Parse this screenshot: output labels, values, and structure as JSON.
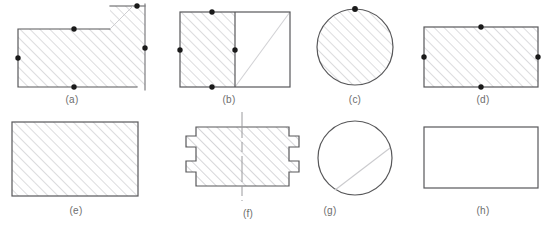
{
  "diagram": {
    "colors": {
      "outline": "#58585a",
      "outline_light": "#7d7d80",
      "hatch": "#c9c9cc",
      "vertex_dot": "#1a1a1a",
      "caption_text": "#6d6d6d",
      "centerline": "#9a9a9d",
      "background": "#ffffff"
    },
    "style": {
      "hatch_angle_deg": 45,
      "hatch_spacing_px": 7,
      "outline_width_px": 1.2,
      "dot_radius_px": 2.6
    },
    "figures": [
      {
        "id": "a",
        "caption": "(a)",
        "shape": "stepped-polygon",
        "hatched": true,
        "dot_count": 4,
        "caption_x": 72,
        "caption_y": 94
      },
      {
        "id": "b",
        "caption": "(b)",
        "shape": "rectangle-divided",
        "hatched": true,
        "dot_count": 4,
        "caption_x": 229,
        "caption_y": 94
      },
      {
        "id": "c",
        "caption": "(c)",
        "shape": "circle",
        "hatched": true,
        "dot_count": 1,
        "caption_x": 355,
        "caption_y": 94
      },
      {
        "id": "d",
        "caption": "(d)",
        "shape": "rectangle",
        "hatched": true,
        "dot_count": 4,
        "caption_x": 483,
        "caption_y": 94
      },
      {
        "id": "e",
        "caption": "(e)",
        "shape": "rectangle",
        "hatched": true,
        "dot_count": 0,
        "caption_x": 76,
        "caption_y": 205
      },
      {
        "id": "f",
        "caption": "(f)",
        "shape": "notched-rectangle",
        "hatched": true,
        "dot_count": 0,
        "caption_x": 248,
        "caption_y": 208
      },
      {
        "id": "g",
        "caption": "(g)",
        "shape": "circle",
        "hatched": false,
        "dot_count": 0,
        "caption_x": 330,
        "caption_y": 205
      },
      {
        "id": "h",
        "caption": "(h)",
        "shape": "rectangle",
        "hatched": false,
        "dot_count": 0,
        "caption_x": 483,
        "caption_y": 205
      }
    ]
  }
}
